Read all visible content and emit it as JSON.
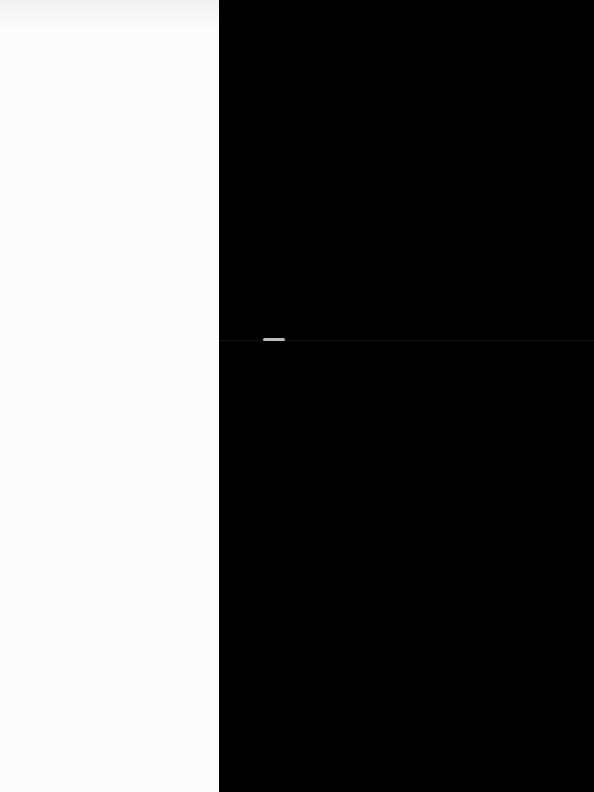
{
  "layout": {
    "left_panel": {
      "color": "#fcfcfc"
    },
    "right_panel": {
      "color": "#010101"
    }
  },
  "right_panel_text": ""
}
